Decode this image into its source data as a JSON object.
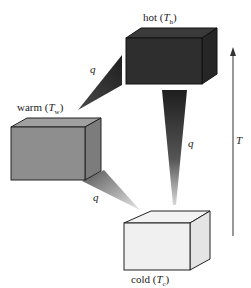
{
  "diagram": {
    "type": "heat-flow",
    "reservoirs": [
      {
        "id": "hot",
        "label": "hot",
        "symbol": "T",
        "subscript": "h",
        "fill": "#2b2b2b"
      },
      {
        "id": "warm",
        "label": "warm",
        "symbol": "T",
        "subscript": "w",
        "fill": "#8a8a8a"
      },
      {
        "id": "cold",
        "label": "cold",
        "symbol": "T",
        "subscript": "c",
        "fill": "#efefef"
      }
    ],
    "flows": [
      {
        "from": "hot",
        "to": "warm",
        "label": "q"
      },
      {
        "from": "hot",
        "to": "cold",
        "label": "q"
      },
      {
        "from": "warm",
        "to": "cold",
        "label": "q"
      }
    ],
    "axis": {
      "label": "T",
      "direction": "up"
    }
  }
}
